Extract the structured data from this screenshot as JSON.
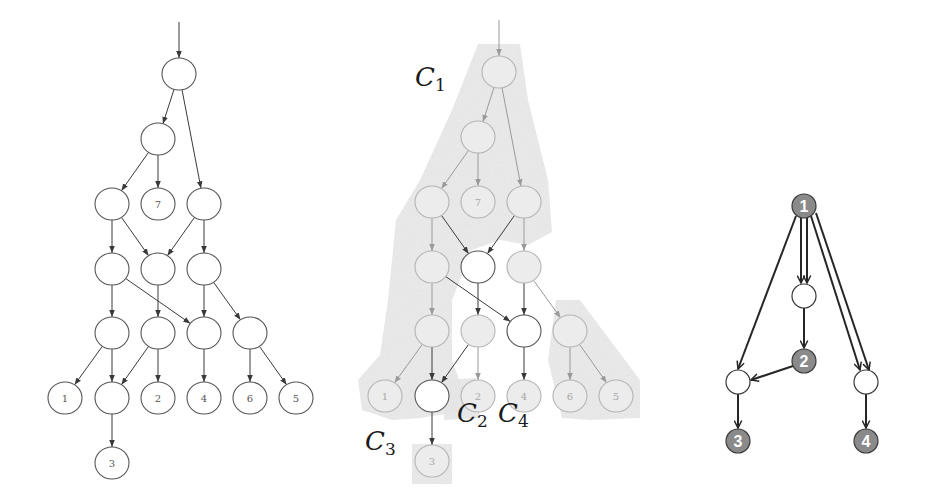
{
  "colors": {
    "edge_dark": "#3a3a3a",
    "edge_faded": "#9a9a9a",
    "node_outline": "#555555",
    "node_faded_outline": "#b4b4b4",
    "region_fill": "#e9e9e9",
    "right_filled_node": "#8a8a8a",
    "right_edge": "#262626"
  },
  "panels": {
    "left": {
      "offset": [
        0,
        0
      ],
      "rx": 17,
      "ry": 16,
      "entry": {
        "from": [
          179,
          22
        ],
        "to": [
          179,
          58
        ]
      },
      "nodes": [
        {
          "id": "r",
          "x": 179,
          "y": 74,
          "label": ""
        },
        {
          "id": "a",
          "x": 158,
          "y": 139,
          "label": ""
        },
        {
          "id": "b1",
          "x": 112,
          "y": 204,
          "label": ""
        },
        {
          "id": "n7",
          "x": 158,
          "y": 204,
          "label": "7"
        },
        {
          "id": "b3",
          "x": 204,
          "y": 204,
          "label": ""
        },
        {
          "id": "c1",
          "x": 112,
          "y": 269,
          "label": ""
        },
        {
          "id": "c2",
          "x": 158,
          "y": 269,
          "label": ""
        },
        {
          "id": "c3",
          "x": 204,
          "y": 269,
          "label": ""
        },
        {
          "id": "d1",
          "x": 112,
          "y": 333,
          "label": ""
        },
        {
          "id": "d2",
          "x": 158,
          "y": 333,
          "label": ""
        },
        {
          "id": "d3",
          "x": 204,
          "y": 333,
          "label": ""
        },
        {
          "id": "d4",
          "x": 250,
          "y": 333,
          "label": ""
        },
        {
          "id": "n1",
          "x": 65,
          "y": 398,
          "label": "1"
        },
        {
          "id": "e2",
          "x": 112,
          "y": 398,
          "label": ""
        },
        {
          "id": "n2",
          "x": 158,
          "y": 398,
          "label": "2"
        },
        {
          "id": "n4",
          "x": 204,
          "y": 398,
          "label": "4"
        },
        {
          "id": "n6",
          "x": 250,
          "y": 398,
          "label": "6"
        },
        {
          "id": "n5",
          "x": 296,
          "y": 398,
          "label": "5"
        },
        {
          "id": "n3",
          "x": 112,
          "y": 463,
          "label": "3"
        }
      ],
      "edges": [
        [
          "r",
          "a"
        ],
        [
          "r",
          "b3"
        ],
        [
          "a",
          "b1"
        ],
        [
          "a",
          "n7"
        ],
        [
          "b1",
          "c1"
        ],
        [
          "b1",
          "c2"
        ],
        [
          "b3",
          "c2"
        ],
        [
          "b3",
          "c3"
        ],
        [
          "c1",
          "d1"
        ],
        [
          "c1",
          "d3"
        ],
        [
          "c2",
          "d2"
        ],
        [
          "c3",
          "d3"
        ],
        [
          "c3",
          "d4"
        ],
        [
          "d1",
          "n1"
        ],
        [
          "d1",
          "e2"
        ],
        [
          "d2",
          "e2"
        ],
        [
          "d2",
          "n2"
        ],
        [
          "d3",
          "n4"
        ],
        [
          "d4",
          "n6"
        ],
        [
          "d4",
          "n5"
        ],
        [
          "e2",
          "n3"
        ]
      ]
    },
    "middle": {
      "offset": [
        320,
        -2
      ],
      "highlighted_nodes": [
        "c2",
        "d3",
        "e2"
      ],
      "dark_edges": [
        [
          "b1",
          "c2"
        ],
        [
          "b3",
          "c2"
        ],
        [
          "c1",
          "d3"
        ],
        [
          "c2",
          "d2"
        ],
        [
          "c3",
          "d3"
        ],
        [
          "d1",
          "e2"
        ],
        [
          "d2",
          "e2"
        ],
        [
          "d3",
          "n4"
        ],
        [
          "e2",
          "n3"
        ]
      ],
      "labels": [
        {
          "name": "C",
          "sub": "1",
          "x": 425,
          "y": 84
        },
        {
          "name": "C",
          "sub": "2",
          "x": 467,
          "y": 420
        },
        {
          "name": "C",
          "sub": "4",
          "x": 508,
          "y": 420
        },
        {
          "name": "C",
          "sub": "3",
          "x": 375,
          "y": 448
        }
      ]
    },
    "right": {
      "r": 12,
      "nodes": [
        {
          "id": "q1",
          "x": 804,
          "y": 206,
          "label": "1",
          "filled": true
        },
        {
          "id": "m",
          "x": 804,
          "y": 296,
          "label": "",
          "filled": false
        },
        {
          "id": "q2",
          "x": 804,
          "y": 361,
          "label": "2",
          "filled": true
        },
        {
          "id": "lb",
          "x": 738,
          "y": 382,
          "label": "",
          "filled": false
        },
        {
          "id": "rb",
          "x": 866,
          "y": 382,
          "label": "",
          "filled": false
        },
        {
          "id": "q3",
          "x": 738,
          "y": 441,
          "label": "3",
          "filled": true
        },
        {
          "id": "q4",
          "x": 866,
          "y": 441,
          "label": "4",
          "filled": true
        }
      ],
      "edges": [
        {
          "from": [
            796,
            216
          ],
          "to": [
            738,
            369
          ]
        },
        {
          "from": [
            801,
            218
          ],
          "to": [
            801,
            283
          ]
        },
        {
          "from": [
            807,
            218
          ],
          "to": [
            807,
            283
          ]
        },
        {
          "from": [
            811,
            216
          ],
          "to": [
            860,
            370
          ]
        },
        {
          "from": [
            816,
            213
          ],
          "to": [
            869,
            370
          ]
        },
        {
          "from": [
            804,
            308
          ],
          "to": [
            804,
            348
          ]
        },
        {
          "from": [
            793,
            366
          ],
          "to": [
            751,
            380
          ]
        },
        {
          "from": [
            738,
            394
          ],
          "to": [
            738,
            428
          ]
        },
        {
          "from": [
            866,
            394
          ],
          "to": [
            866,
            428
          ]
        }
      ]
    }
  }
}
